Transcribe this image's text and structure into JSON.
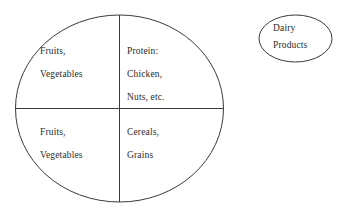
{
  "figure": {
    "type": "food-plate-diagram",
    "background_color": "#ffffff",
    "stroke_color": "#3a3a3a",
    "text_color": "#2b2b2b",
    "circle": {
      "name": "plate-circle",
      "center_x": 119.5,
      "center_y": 108,
      "radius_x": 104,
      "radius_y": 93.5,
      "divided_by": [
        "vertical-divider",
        "horizontal-divider"
      ]
    },
    "ellipse": {
      "name": "dairy-ellipse",
      "center_x": 295.5,
      "center_y": 38.5,
      "radius_x": 36.5,
      "radius_y": 23.5
    },
    "quadrants": {
      "upper_left": {
        "name": "upper-left-quadrant",
        "lines": [
          "Fruits,",
          "Vegetables"
        ]
      },
      "upper_right": {
        "name": "upper-right-quadrant",
        "lines": [
          "Protein:",
          "Chicken,",
          "Nuts, etc."
        ]
      },
      "lower_left": {
        "name": "lower-left-quadrant",
        "lines": [
          "Fruits,",
          "Vegetables"
        ]
      },
      "lower_right": {
        "name": "lower-right-quadrant",
        "lines": [
          "Cereals,",
          "Grains"
        ]
      }
    },
    "side_group": {
      "name": "dairy-group",
      "lines": [
        "Dairy",
        "Products"
      ]
    }
  }
}
